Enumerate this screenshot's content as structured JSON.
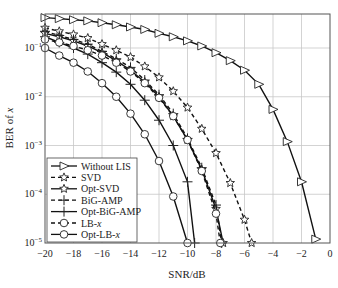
{
  "chart_data": {
    "type": "line",
    "title": "",
    "xlabel": "SNR/dB",
    "ylabel": "BER of x",
    "xlim": [
      -20,
      0
    ],
    "ylim": [
      1e-05,
      0.5
    ],
    "yscale": "log",
    "grid": true,
    "legend_position": "lower left",
    "xticks": [
      "-20",
      "-18",
      "-16",
      "-14",
      "-12",
      "-10",
      "-8",
      "-6",
      "-4",
      "-2",
      "0"
    ],
    "yticks": [
      "10^-1",
      "10^-2",
      "10^-3",
      "10^-4",
      "10^-5"
    ],
    "series": [
      {
        "name": "Without LIS",
        "marker": "triangle-right",
        "dash": false,
        "x": [
          -20,
          -19,
          -18,
          -17,
          -16,
          -15,
          -14,
          -13,
          -12,
          -11,
          -10,
          -9,
          -8,
          -7,
          -6,
          -5,
          -4,
          -3,
          -2,
          -1
        ],
        "y": [
          0.42,
          0.4,
          0.38,
          0.36,
          0.33,
          0.3,
          0.27,
          0.24,
          0.2,
          0.17,
          0.14,
          0.11,
          0.08,
          0.055,
          0.035,
          0.018,
          0.0055,
          0.0012,
          0.00018,
          1.2e-05
        ]
      },
      {
        "name": "SVD",
        "marker": "star",
        "dash": true,
        "x": [
          -20,
          -19,
          -18,
          -17,
          -16,
          -15,
          -14,
          -13,
          -12,
          -11,
          -10,
          -9,
          -8,
          -7,
          -6,
          -5.5
        ],
        "y": [
          0.26,
          0.22,
          0.19,
          0.16,
          0.12,
          0.09,
          0.065,
          0.042,
          0.025,
          0.013,
          0.006,
          0.0022,
          0.0007,
          0.00017,
          3e-05,
          1e-05
        ]
      },
      {
        "name": "Opt-SVD",
        "marker": "star",
        "dash": false,
        "x": [
          -20,
          -19,
          -18,
          -17,
          -16,
          -15,
          -14,
          -13,
          -12,
          -11,
          -10,
          -9,
          -8,
          -7.5
        ],
        "y": [
          0.2,
          0.17,
          0.14,
          0.11,
          0.08,
          0.055,
          0.035,
          0.02,
          0.01,
          0.004,
          0.0013,
          0.00032,
          5e-05,
          1e-05
        ]
      },
      {
        "name": "BiG-AMP",
        "marker": "plus",
        "dash": true,
        "x": [
          -20,
          -19,
          -18,
          -17,
          -16,
          -15,
          -14,
          -13,
          -12,
          -11,
          -10,
          -9,
          -8,
          -7.6
        ],
        "y": [
          0.22,
          0.18,
          0.15,
          0.12,
          0.085,
          0.06,
          0.04,
          0.022,
          0.011,
          0.0045,
          0.0014,
          0.00035,
          6e-05,
          1e-05
        ]
      },
      {
        "name": "Opt-BiG-AMP",
        "marker": "plus",
        "dash": false,
        "x": [
          -20,
          -19,
          -18,
          -17,
          -16,
          -15,
          -14,
          -13,
          -12,
          -11,
          -10,
          -9.5
        ],
        "y": [
          0.17,
          0.13,
          0.1,
          0.075,
          0.05,
          0.032,
          0.018,
          0.0085,
          0.0033,
          0.001,
          0.00018,
          1e-05
        ]
      },
      {
        "name": "LB-x",
        "marker": "circle",
        "dash": true,
        "x": [
          -20,
          -19,
          -18,
          -17,
          -16,
          -15,
          -14,
          -13,
          -12,
          -11,
          -10,
          -9,
          -8,
          -7.7
        ],
        "y": [
          0.15,
          0.13,
          0.11,
          0.09,
          0.07,
          0.05,
          0.033,
          0.019,
          0.0095,
          0.004,
          0.0013,
          0.0003,
          4e-05,
          1e-05
        ]
      },
      {
        "name": "Opt-LB-x",
        "marker": "circle",
        "dash": false,
        "x": [
          -20,
          -19,
          -18,
          -17,
          -16,
          -15,
          -14,
          -13,
          -12,
          -11,
          -10
        ],
        "y": [
          0.1,
          0.07,
          0.05,
          0.033,
          0.019,
          0.01,
          0.0045,
          0.0017,
          0.00048,
          9e-05,
          1e-05
        ]
      }
    ]
  },
  "axes": {
    "xlabel": "SNR/dB",
    "ylabel_text": "BER of ",
    "ylabel_var": "x"
  },
  "legend": {
    "items": [
      {
        "label": "Without LIS"
      },
      {
        "label": "SVD"
      },
      {
        "label": "Opt-SVD"
      },
      {
        "label": "BiG-AMP"
      },
      {
        "label": "Opt-BiG-AMP"
      },
      {
        "label": "LB-",
        "var": "x"
      },
      {
        "label": "Opt-LB-",
        "var": "x"
      }
    ]
  }
}
